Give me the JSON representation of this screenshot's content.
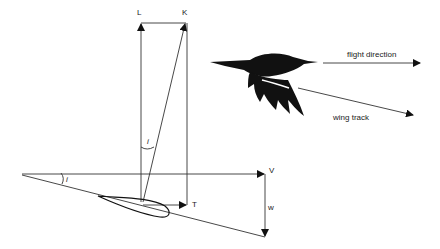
{
  "diagram": {
    "vectors": {
      "lift": "L",
      "resultant": "K",
      "velocity": "V",
      "thrust": "T",
      "downwash": "w"
    },
    "angles": {
      "incidence_top": "i",
      "incidence_bottom": "i"
    },
    "bird_labels": {
      "flight_direction": "flight direction",
      "wing_track": "wing track"
    },
    "colors": {
      "line": "#333333",
      "silhouette": "#111111",
      "background": "#ffffff"
    }
  }
}
